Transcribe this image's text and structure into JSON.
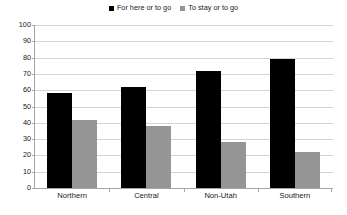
{
  "chart_data": {
    "type": "bar",
    "title": "",
    "subtitle": "",
    "xlabel": "",
    "ylabel": "",
    "categories": [
      "Northern",
      "Central",
      "Non-Utah",
      "Southern"
    ],
    "series": [
      {
        "name": "For here or to go",
        "color": "#000000",
        "values": [
          58,
          62,
          72,
          79
        ]
      },
      {
        "name": "To stay or to go",
        "color": "#959595",
        "values": [
          42,
          38,
          28,
          22
        ]
      }
    ],
    "ylim": [
      0,
      100
    ],
    "ytick_step": 10,
    "yticks": [
      100,
      90,
      80,
      70,
      60,
      50,
      40,
      30,
      20,
      10,
      0
    ],
    "grid": true,
    "legend_position": "top-center",
    "annotations": []
  },
  "legend": {
    "entries": [
      {
        "label": "For here or to go",
        "swatch": "#000000"
      },
      {
        "label": "To stay or to go",
        "swatch": "#959595"
      }
    ]
  },
  "axes": {
    "y_tick_labels": [
      "100",
      "90",
      "80",
      "70",
      "60",
      "50",
      "40",
      "30",
      "20",
      "10",
      "0"
    ],
    "x_tick_labels": [
      "Northern",
      "Central",
      "Non-Utah",
      "Southern"
    ]
  },
  "colors": {
    "series_black": "#000000",
    "series_gray": "#959595",
    "gridline": "#d4d4d4",
    "axis": "#a6a6a6",
    "text": "#1a1a1a",
    "background": "#ffffff"
  }
}
